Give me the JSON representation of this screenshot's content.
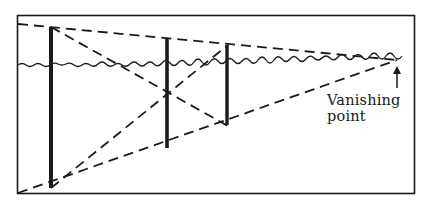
{
  "diagram": {
    "title": "",
    "type": "perspective-vanishing-point",
    "labels": {
      "vanishing_point_line1": "Vanishing",
      "vanishing_point_line2": "point"
    },
    "colors": {
      "ink": "#1a1a1a",
      "background": "#ffffff"
    },
    "elements": {
      "frame": "rectangle border",
      "horizon": "wavy horizon line",
      "poles": 3,
      "converging_dashed_lines": 4,
      "arrow": "up arrow pointing to vanishing point"
    }
  }
}
